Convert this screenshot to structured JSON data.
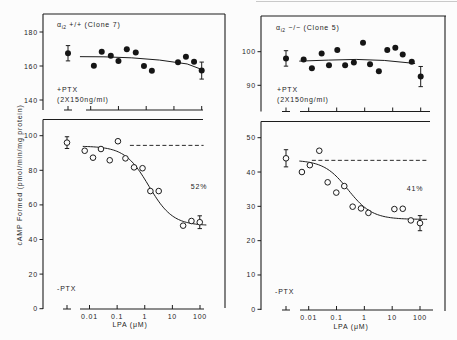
{
  "figure": {
    "ylabel": "cAMP Formed (pmol/min/mg protein)",
    "xlabel": "LPA (μM)"
  },
  "chart_data": [
    {
      "panel": "top-left",
      "type": "scatter",
      "title": {
        "greek": "α",
        "subscript": "i2",
        "text": "+/+ (Clone 7)"
      },
      "condition": [
        "+PTX",
        "(2X150ng/ml)"
      ],
      "marker": "filled",
      "xscale": "log",
      "xlabel": "",
      "xticks": [
        0.01,
        0.1,
        1,
        10,
        100
      ],
      "xtick_labels": [],
      "yticks": [
        140,
        160,
        180
      ],
      "ytick_labels": [
        "140",
        "160",
        "180"
      ],
      "ylim": [
        138,
        188
      ],
      "control": {
        "y": 167.5,
        "err": 4.5
      },
      "x": [
        0.013,
        0.025,
        0.053,
        0.1,
        0.2,
        0.42,
        0.83,
        1.6,
        14,
        27,
        53,
        100
      ],
      "y": [
        160.2,
        168.4,
        166,
        163,
        169.8,
        168,
        160,
        157.2,
        162.2,
        165.5,
        162.5,
        157.3
      ],
      "errors": [
        {
          "index": 11,
          "err": 5
        }
      ],
      "fit": {
        "type": "line",
        "x": [
          0.0041,
          0.03,
          0.3,
          3,
          30,
          115
        ],
        "y": [
          165.5,
          165.4,
          164.8,
          163.5,
          161.2,
          157.6
        ]
      }
    },
    {
      "panel": "bottom-left",
      "type": "scatter",
      "condition": [
        "-PTX"
      ],
      "marker": "open",
      "xscale": "log",
      "xlabel": "LPA (μM)",
      "xticks": [
        0.01,
        0.1,
        1,
        10,
        100
      ],
      "xtick_labels": [
        "0.01",
        "0.1",
        "1",
        "10",
        "100"
      ],
      "yticks": [
        0,
        20,
        40,
        60,
        80,
        100
      ],
      "ytick_labels": [
        "0",
        "20",
        "40",
        "60",
        "80",
        "100"
      ],
      "ylim": [
        0,
        110
      ],
      "control": {
        "y": 96,
        "err": 3.4
      },
      "x": [
        0.0067,
        0.0134,
        0.026,
        0.054,
        0.107,
        0.2,
        0.41,
        0.83,
        1.6,
        3.2,
        24.5,
        49,
        98
      ],
      "y": [
        91.3,
        87.3,
        92.3,
        85.8,
        96.8,
        86.9,
        81.7,
        81.2,
        68,
        68,
        48,
        50.7,
        50
      ],
      "errors": [
        {
          "index": 12,
          "err": 3.7
        }
      ],
      "fit": {
        "type": "sigmoid",
        "top": 94,
        "bottom": 48,
        "ec50": 1.4,
        "hill": 1,
        "xrange": [
          0.0057,
          170
        ]
      },
      "ref_line": {
        "y": 94.4,
        "xrange": [
          0.29,
          135
        ]
      },
      "annotation": "52%"
    },
    {
      "panel": "top-right",
      "type": "scatter",
      "title": {
        "greek": "α",
        "subscript": "i2",
        "text": "−/− (Clone 5)"
      },
      "condition": [
        "+PTX",
        "(2X150ng/ml)"
      ],
      "marker": "filled",
      "xscale": "log",
      "xlabel": "",
      "xticks": [
        0.01,
        0.1,
        1,
        10,
        100
      ],
      "xtick_labels": [],
      "yticks": [
        90,
        100
      ],
      "ytick_labels": [
        "90",
        "100"
      ],
      "ylim": [
        82,
        110
      ],
      "control": {
        "y": 98,
        "err": 2.3
      },
      "x": [
        0.0066,
        0.013,
        0.029,
        0.053,
        0.105,
        0.2,
        0.41,
        0.87,
        1.55,
        3.2,
        6.4,
        12.4,
        22.8,
        48,
        100
      ],
      "y": [
        97.7,
        95.1,
        99.5,
        96,
        100.5,
        96,
        96.8,
        102.7,
        96.3,
        94.2,
        100.5,
        101.2,
        99.2,
        97,
        92.6
      ],
      "errors": [
        {
          "index": 14,
          "err": 3
        }
      ],
      "fit": {
        "type": "line",
        "x": [
          0.0046,
          0.05,
          0.5,
          5,
          63
        ],
        "y": [
          97.2,
          97.5,
          97.7,
          97.4,
          96.5
        ]
      }
    },
    {
      "panel": "bottom-right",
      "type": "scatter",
      "condition": [
        "-PTX"
      ],
      "marker": "open",
      "xscale": "log",
      "xlabel": "LPA (μM)",
      "xticks": [
        0.01,
        0.1,
        1,
        10,
        100
      ],
      "xtick_labels": [
        "0.01",
        "0.1",
        "1",
        "10",
        "100"
      ],
      "yticks": [
        0,
        10,
        20,
        30,
        40,
        50
      ],
      "ytick_labels": [
        "0",
        "10",
        "20",
        "30",
        "40",
        "50"
      ],
      "ylim": [
        0,
        55
      ],
      "control": {
        "y": 44,
        "err": 2.5
      },
      "x": [
        0.0057,
        0.011,
        0.024,
        0.048,
        0.098,
        0.19,
        0.38,
        0.76,
        1.4,
        12,
        24,
        47,
        100
      ],
      "y": [
        40,
        42,
        46.2,
        37,
        34,
        35.9,
        29.9,
        29.4,
        28.1,
        29.2,
        29.3,
        25.9,
        25.1
      ],
      "errors": [
        {
          "index": 12,
          "err": 2.2
        }
      ],
      "fit": {
        "type": "sigmoid",
        "top": 43.5,
        "bottom": 26.2,
        "ec50": 0.26,
        "hill": 1,
        "xrange": [
          0.0046,
          180
        ]
      },
      "ref_line": {
        "y": 43.4,
        "xrange": [
          0.013,
          180
        ]
      },
      "annotation": "41%"
    }
  ]
}
